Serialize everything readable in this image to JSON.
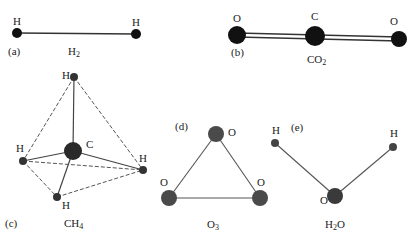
{
  "colors": {
    "atom_dark": "#111111",
    "atom_gray": "#4a4a4a",
    "bond": "#444444",
    "text": "#222222"
  },
  "panels": [
    {
      "id": "a",
      "tag": "(a)",
      "formula": "H",
      "formula_sub": "2",
      "atoms": [
        {
          "symbol": "H",
          "x": 17,
          "y": 33
        },
        {
          "symbol": "H",
          "x": 136,
          "y": 34
        }
      ]
    },
    {
      "id": "b",
      "tag": "(b)",
      "formula": "CO",
      "formula_sub": "2",
      "atoms": [
        {
          "symbol": "O",
          "x": 237,
          "y": 35
        },
        {
          "symbol": "C",
          "x": 315,
          "y": 36
        },
        {
          "symbol": "O",
          "x": 399,
          "y": 39
        }
      ]
    },
    {
      "id": "c",
      "tag": "(c)",
      "formula": "CH",
      "formula_sub": "4",
      "atoms": [
        {
          "symbol": "H",
          "x": 74,
          "y": 77
        },
        {
          "symbol": "C",
          "x": 73,
          "y": 151
        },
        {
          "symbol": "H",
          "x": 23,
          "y": 161
        },
        {
          "symbol": "H",
          "x": 143,
          "y": 170
        },
        {
          "symbol": "H",
          "x": 57,
          "y": 197
        }
      ]
    },
    {
      "id": "d",
      "tag": "(d)",
      "formula": "O",
      "formula_sub": "3",
      "atoms": [
        {
          "symbol": "O",
          "x": 216,
          "y": 134
        },
        {
          "symbol": "O",
          "x": 169,
          "y": 198
        },
        {
          "symbol": "O",
          "x": 260,
          "y": 198
        }
      ]
    },
    {
      "id": "e",
      "tag": "(e)",
      "formula": "H",
      "formula_mid": "2",
      "formula_tail": "O",
      "atoms": [
        {
          "symbol": "H",
          "x": 275,
          "y": 143
        },
        {
          "symbol": "O",
          "x": 335,
          "y": 196
        },
        {
          "symbol": "H",
          "x": 393,
          "y": 147
        }
      ]
    }
  ]
}
